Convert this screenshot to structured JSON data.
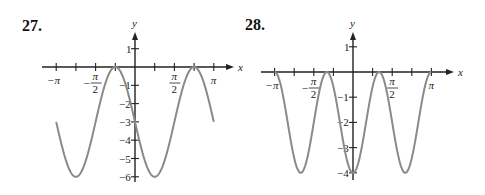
{
  "chart_data": [
    {
      "type": "line",
      "label": "27.",
      "function": "y = -3 - 3 sin(2x)",
      "x_domain": [
        "-π",
        "π"
      ],
      "xlabel": "x",
      "ylabel": "y",
      "x_tick_labels": [
        "-π",
        "-π/2",
        "π/2",
        "π"
      ],
      "y_tick_labels": [
        "1",
        "-1",
        "-2",
        "-3",
        "-4",
        "-5",
        "-6"
      ],
      "ylim": [
        -6,
        1
      ],
      "grid": false,
      "key_points": [
        {
          "x": "-π",
          "y": -3
        },
        {
          "x": "-3π/4",
          "y": -6
        },
        {
          "x": "-π/4",
          "y": 0
        },
        {
          "x": "π/4",
          "y": -6
        },
        {
          "x": "3π/4",
          "y": 0
        },
        {
          "x": "π",
          "y": -3
        }
      ],
      "color": "#8a8a8a"
    },
    {
      "type": "line",
      "label": "28.",
      "function": "y = -2 - 2 cos(3x)",
      "x_domain": [
        "-π",
        "π"
      ],
      "xlabel": "x",
      "ylabel": "y",
      "x_tick_labels": [
        "-π",
        "-π/2",
        "π/2",
        "π"
      ],
      "y_tick_labels": [
        "1",
        "-1",
        "-2",
        "-3",
        "-4"
      ],
      "ylim": [
        -4,
        1
      ],
      "grid": false,
      "key_points": [
        {
          "x": "-π",
          "y": 0
        },
        {
          "x": "-2π/3",
          "y": -4
        },
        {
          "x": "-π/3",
          "y": 0
        },
        {
          "x": "0",
          "y": -4
        },
        {
          "x": "π/3",
          "y": 0
        },
        {
          "x": "2π/3",
          "y": -4
        },
        {
          "x": "π",
          "y": 0
        }
      ],
      "color": "#8a8a8a"
    }
  ],
  "labels": {
    "p27": "27.",
    "p28": "28."
  }
}
